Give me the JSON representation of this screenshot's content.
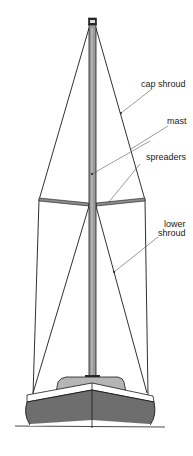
{
  "diagram": {
    "labels": {
      "cap_shroud": "cap shroud",
      "mast": "mast",
      "spreaders": "spreaders",
      "lower_shroud_line1": "lower",
      "lower_shroud_line2": "shroud"
    },
    "colors": {
      "background": "#ffffff",
      "line": "#1a1a1a",
      "mast_fill": "#9a9a9a",
      "hull_fill": "#6e6e6e",
      "deckhouse_fill": "#b5b5b5",
      "leader": "#555555"
    }
  }
}
